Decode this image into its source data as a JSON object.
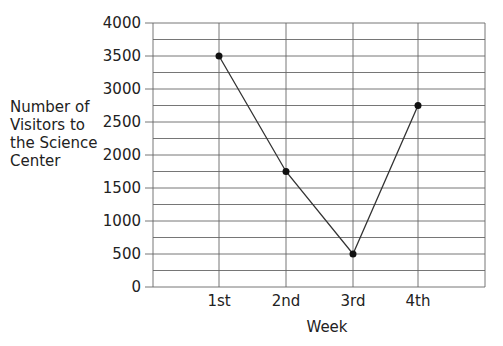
{
  "chart_data": {
    "type": "line",
    "title": "",
    "xlabel": "Week",
    "ylabel_lines": [
      "Number of",
      "Visitors to",
      "the Science",
      "Center"
    ],
    "ylabel": "Number of Visitors to the Science Center",
    "categories": [
      "1st",
      "2nd",
      "3rd",
      "4th"
    ],
    "values": [
      3500,
      1750,
      500,
      2750
    ],
    "ylim": [
      0,
      4000
    ],
    "yticks": [
      0,
      500,
      1000,
      1500,
      2000,
      2500,
      3000,
      3500,
      4000
    ],
    "minor_grid_step": 250,
    "grid": true,
    "legend": null,
    "line_color": "#333333",
    "marker": "filled-circle"
  }
}
